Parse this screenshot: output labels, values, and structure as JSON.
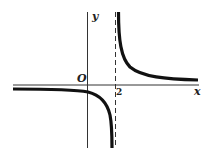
{
  "figure": {
    "title": "",
    "function": "hyperbola y = k/(x-2), k>0",
    "labels": {
      "x_axis": "x",
      "y_axis": "y",
      "origin": "O",
      "asymptote_value": "2"
    },
    "vertical_asymptote": 2,
    "horizontal_asymptote": 0,
    "colors": {
      "curve": "#111111",
      "axis": "#222222",
      "background": "#ffffff"
    }
  }
}
